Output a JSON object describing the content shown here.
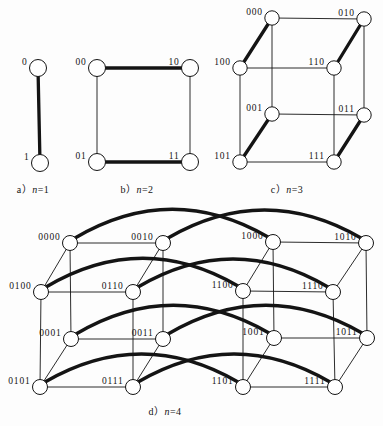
{
  "figure": {
    "canvas": {
      "width": 383,
      "height": 426,
      "background": "#fdfdfd"
    },
    "style": {
      "line_color": "#141414",
      "thin_width": 0.9,
      "thick_width": 3.3,
      "node_fill": "#ffffff",
      "node_stroke_width": 1,
      "arc_rise": 61
    },
    "panels": [
      {
        "key": "hypercube-n1",
        "caption": {
          "prefix": "a）",
          "var": "n",
          "rest": "=1",
          "x": 33,
          "y": 181
        },
        "node_radius": 8.5,
        "nodes": [
          {
            "id": "0",
            "x": 38,
            "y": 68
          },
          {
            "id": "1",
            "x": 40,
            "y": 163
          }
        ],
        "edges": [
          {
            "a": "0",
            "b": "1",
            "w": "thick"
          }
        ]
      },
      {
        "key": "hypercube-n2",
        "caption": {
          "prefix": "b）",
          "var": "n",
          "rest": "=2",
          "x": 137,
          "y": 181
        },
        "node_radius": 8.5,
        "nodes": [
          {
            "id": "00",
            "x": 97,
            "y": 68
          },
          {
            "id": "10",
            "x": 190,
            "y": 68
          },
          {
            "id": "01",
            "x": 97,
            "y": 162
          },
          {
            "id": "11",
            "x": 190,
            "y": 162
          }
        ],
        "edges": [
          {
            "a": "00",
            "b": "10",
            "w": "thick"
          },
          {
            "a": "01",
            "b": "11",
            "w": "thick"
          },
          {
            "a": "00",
            "b": "01",
            "w": "thin"
          },
          {
            "a": "10",
            "b": "11",
            "w": "thin"
          }
        ]
      },
      {
        "key": "hypercube-n3",
        "caption": {
          "prefix": "c）",
          "var": "n",
          "rest": "=3",
          "x": 287,
          "y": 181
        },
        "node_radius": 7.2,
        "nodes": [
          {
            "id": "000",
            "x": 272,
            "y": 18
          },
          {
            "id": "010",
            "x": 364,
            "y": 19
          },
          {
            "id": "100",
            "x": 240,
            "y": 68
          },
          {
            "id": "110",
            "x": 334,
            "y": 68
          },
          {
            "id": "001",
            "x": 272,
            "y": 114
          },
          {
            "id": "011",
            "x": 364,
            "y": 115
          },
          {
            "id": "101",
            "x": 240,
            "y": 162
          },
          {
            "id": "111",
            "x": 334,
            "y": 162
          }
        ],
        "edges": [
          {
            "a": "000",
            "b": "010",
            "w": "thin"
          },
          {
            "a": "100",
            "b": "110",
            "w": "thin"
          },
          {
            "a": "001",
            "b": "011",
            "w": "thin"
          },
          {
            "a": "101",
            "b": "111",
            "w": "thin"
          },
          {
            "a": "000",
            "b": "001",
            "w": "thin"
          },
          {
            "a": "010",
            "b": "011",
            "w": "thin"
          },
          {
            "a": "100",
            "b": "101",
            "w": "thin"
          },
          {
            "a": "110",
            "b": "111",
            "w": "thin"
          },
          {
            "a": "000",
            "b": "100",
            "w": "thick"
          },
          {
            "a": "010",
            "b": "110",
            "w": "thick"
          },
          {
            "a": "001",
            "b": "101",
            "w": "thick"
          },
          {
            "a": "011",
            "b": "111",
            "w": "thick"
          }
        ]
      },
      {
        "key": "hypercube-n4",
        "caption": {
          "prefix": "d）",
          "var": "n",
          "rest": "=4",
          "x": 165,
          "y": 403
        },
        "node_radius": 7.5,
        "nodes": [
          {
            "id": "0000",
            "x": 70,
            "y": 243
          },
          {
            "id": "0010",
            "x": 163,
            "y": 243
          },
          {
            "id": "1000",
            "x": 273,
            "y": 242
          },
          {
            "id": "1010",
            "x": 366,
            "y": 243
          },
          {
            "id": "0100",
            "x": 41,
            "y": 292
          },
          {
            "id": "0110",
            "x": 133,
            "y": 292
          },
          {
            "id": "1100",
            "x": 243,
            "y": 291
          },
          {
            "id": "1110",
            "x": 333,
            "y": 292
          },
          {
            "id": "0001",
            "x": 71,
            "y": 339
          },
          {
            "id": "0011",
            "x": 163,
            "y": 339
          },
          {
            "id": "1001",
            "x": 274,
            "y": 338
          },
          {
            "id": "1011",
            "x": 367,
            "y": 338
          },
          {
            "id": "0101",
            "x": 40,
            "y": 387
          },
          {
            "id": "0111",
            "x": 133,
            "y": 387
          },
          {
            "id": "1101",
            "x": 243,
            "y": 387
          },
          {
            "id": "1111",
            "x": 335,
            "y": 387
          }
        ],
        "edges": [
          {
            "a": "0000",
            "b": "0010",
            "w": "thin"
          },
          {
            "a": "1000",
            "b": "1010",
            "w": "thin"
          },
          {
            "a": "0100",
            "b": "0110",
            "w": "thin"
          },
          {
            "a": "1100",
            "b": "1110",
            "w": "thin"
          },
          {
            "a": "0001",
            "b": "0011",
            "w": "thin"
          },
          {
            "a": "1001",
            "b": "1011",
            "w": "thin"
          },
          {
            "a": "0101",
            "b": "0111",
            "w": "thin"
          },
          {
            "a": "1101",
            "b": "1111",
            "w": "thin"
          },
          {
            "a": "0000",
            "b": "0100",
            "w": "thin"
          },
          {
            "a": "0010",
            "b": "0110",
            "w": "thin"
          },
          {
            "a": "1000",
            "b": "1100",
            "w": "thin"
          },
          {
            "a": "1010",
            "b": "1110",
            "w": "thin"
          },
          {
            "a": "0001",
            "b": "0101",
            "w": "thin"
          },
          {
            "a": "0011",
            "b": "0111",
            "w": "thin"
          },
          {
            "a": "1001",
            "b": "1101",
            "w": "thin"
          },
          {
            "a": "1011",
            "b": "1111",
            "w": "thin"
          },
          {
            "a": "0000",
            "b": "0001",
            "w": "thin"
          },
          {
            "a": "0010",
            "b": "0011",
            "w": "thin"
          },
          {
            "a": "1000",
            "b": "1001",
            "w": "thin"
          },
          {
            "a": "1010",
            "b": "1011",
            "w": "thin"
          },
          {
            "a": "0100",
            "b": "0101",
            "w": "thin"
          },
          {
            "a": "0110",
            "b": "0111",
            "w": "thin"
          },
          {
            "a": "1100",
            "b": "1101",
            "w": "thin"
          },
          {
            "a": "1110",
            "b": "1111",
            "w": "thin"
          },
          {
            "a": "0000",
            "b": "1000",
            "w": "thick",
            "arc": true
          },
          {
            "a": "0010",
            "b": "1010",
            "w": "thick",
            "arc": true
          },
          {
            "a": "0100",
            "b": "1100",
            "w": "thick",
            "arc": true
          },
          {
            "a": "0110",
            "b": "1110",
            "w": "thick",
            "arc": true
          },
          {
            "a": "0001",
            "b": "1001",
            "w": "thick",
            "arc": true
          },
          {
            "a": "0011",
            "b": "1011",
            "w": "thick",
            "arc": true
          },
          {
            "a": "0101",
            "b": "1101",
            "w": "thick",
            "arc": true
          },
          {
            "a": "0111",
            "b": "1111",
            "w": "thick",
            "arc": true
          }
        ]
      }
    ]
  }
}
